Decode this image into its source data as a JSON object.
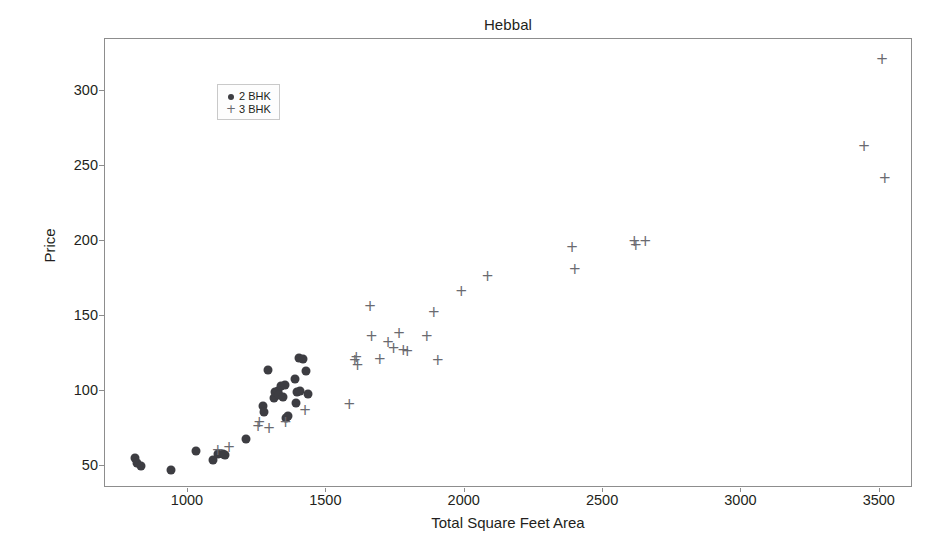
{
  "chart_data": {
    "type": "scatter",
    "title": "Hebbal",
    "xlabel": "Total Square Feet Area",
    "ylabel": "Price",
    "xlim": [
      700,
      3620
    ],
    "ylim": [
      35,
      335
    ],
    "xticks": [
      1000,
      1500,
      2000,
      2500,
      3000,
      3500
    ],
    "xtick_labels": [
      "1000",
      "1500",
      "2000",
      "2500",
      "3000",
      "3500"
    ],
    "yticks": [
      50,
      100,
      150,
      200,
      250,
      300
    ],
    "ytick_labels": [
      "50",
      "100",
      "150",
      "200",
      "250",
      "300"
    ],
    "grid": false,
    "legend_position": "upper left",
    "series": [
      {
        "name": "2 BHK",
        "marker": "circle",
        "color": "#3d3d42",
        "points": [
          [
            810,
            55
          ],
          [
            815,
            52
          ],
          [
            830,
            50
          ],
          [
            940,
            47
          ],
          [
            1030,
            60
          ],
          [
            1090,
            54
          ],
          [
            1110,
            58
          ],
          [
            1125,
            58
          ],
          [
            1135,
            57
          ],
          [
            1210,
            68
          ],
          [
            1270,
            90
          ],
          [
            1275,
            86
          ],
          [
            1290,
            114
          ],
          [
            1310,
            95
          ],
          [
            1315,
            99
          ],
          [
            1325,
            100
          ],
          [
            1330,
            97
          ],
          [
            1335,
            103
          ],
          [
            1345,
            96
          ],
          [
            1350,
            104
          ],
          [
            1355,
            82
          ],
          [
            1360,
            83
          ],
          [
            1385,
            108
          ],
          [
            1390,
            92
          ],
          [
            1395,
            99
          ],
          [
            1400,
            122
          ],
          [
            1405,
            100
          ],
          [
            1415,
            121
          ],
          [
            1425,
            113
          ],
          [
            1435,
            98
          ]
        ]
      },
      {
        "name": "3 BHK",
        "marker": "plus",
        "color": "#6a6a70",
        "points": [
          [
            1105,
            59
          ],
          [
            1145,
            61
          ],
          [
            1250,
            75
          ],
          [
            1255,
            78
          ],
          [
            1290,
            74
          ],
          [
            1350,
            78
          ],
          [
            1420,
            86
          ],
          [
            1580,
            90
          ],
          [
            1600,
            119
          ],
          [
            1605,
            121
          ],
          [
            1610,
            116
          ],
          [
            1655,
            155
          ],
          [
            1660,
            135
          ],
          [
            1690,
            120
          ],
          [
            1720,
            131
          ],
          [
            1740,
            127
          ],
          [
            1760,
            137
          ],
          [
            1775,
            126
          ],
          [
            1790,
            125
          ],
          [
            1860,
            135
          ],
          [
            1885,
            151
          ],
          [
            1900,
            119
          ],
          [
            1985,
            165
          ],
          [
            2080,
            175
          ],
          [
            2385,
            195
          ],
          [
            2395,
            180
          ],
          [
            2610,
            199
          ],
          [
            2615,
            196
          ],
          [
            2650,
            199
          ],
          [
            3440,
            262
          ],
          [
            3505,
            320
          ],
          [
            3515,
            241
          ]
        ]
      }
    ]
  }
}
